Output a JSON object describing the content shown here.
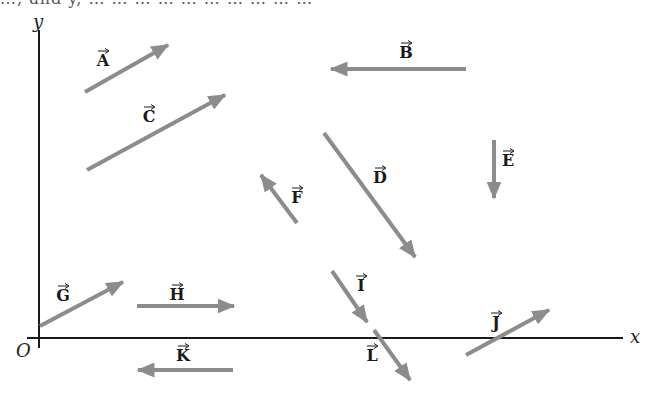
{
  "header_fragment": "…, and y, … … … … … … … … … …",
  "colors": {
    "axis": "#1a1a1a",
    "vector": "#8c8c8c",
    "label": "#1a1a1a",
    "background": "#ffffff"
  },
  "axes": {
    "x_label": "x",
    "y_label": "y",
    "origin_label": "O",
    "x_axis": {
      "x1": 27,
      "y1": 338,
      "x2": 623,
      "y2": 338
    },
    "y_axis": {
      "x1": 39,
      "y1": 30,
      "x2": 39,
      "y2": 348
    }
  },
  "vectors": [
    {
      "name": "A",
      "from": [
        85,
        92
      ],
      "to": [
        168,
        45
      ],
      "label_pos": [
        103,
        66
      ]
    },
    {
      "name": "B",
      "from": [
        466,
        69
      ],
      "to": [
        331,
        69
      ],
      "label_pos": [
        406,
        58
      ]
    },
    {
      "name": "C",
      "from": [
        87,
        170
      ],
      "to": [
        225,
        95
      ],
      "label_pos": [
        149,
        122
      ]
    },
    {
      "name": "D",
      "from": [
        324,
        133
      ],
      "to": [
        415,
        257
      ],
      "label_pos": [
        380,
        183
      ]
    },
    {
      "name": "E",
      "from": [
        494,
        140
      ],
      "to": [
        494,
        198
      ],
      "label_pos": [
        508,
        166
      ]
    },
    {
      "name": "F",
      "from": [
        297,
        223
      ],
      "to": [
        261,
        175
      ],
      "label_pos": [
        297,
        203
      ]
    },
    {
      "name": "G",
      "from": [
        40,
        326
      ],
      "to": [
        123,
        282
      ],
      "label_pos": [
        63,
        301
      ]
    },
    {
      "name": "H",
      "from": [
        137,
        306
      ],
      "to": [
        234,
        306
      ],
      "label_pos": [
        177,
        300
      ]
    },
    {
      "name": "I",
      "from": [
        332,
        271
      ],
      "to": [
        367,
        322
      ],
      "label_pos": [
        361,
        291
      ]
    },
    {
      "name": "J",
      "from": [
        466,
        355
      ],
      "to": [
        549,
        310
      ],
      "label_pos": [
        496,
        328
      ]
    },
    {
      "name": "K",
      "from": [
        233,
        370
      ],
      "to": [
        138,
        370
      ],
      "label_pos": [
        183,
        361
      ]
    },
    {
      "name": "L",
      "from": [
        374,
        330
      ],
      "to": [
        410,
        380
      ],
      "label_pos": [
        372,
        361
      ]
    }
  ]
}
